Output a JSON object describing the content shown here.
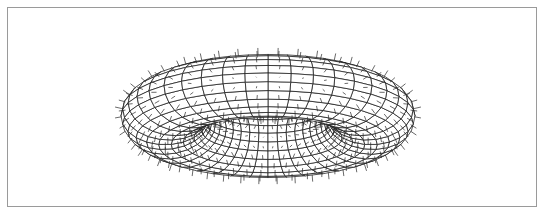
{
  "figure": {
    "caption": "",
    "colors": {
      "background": "#ffffff",
      "frame": "#9a9a9a",
      "wire": "#1a1a1a",
      "normals": "#2a2a2a",
      "fill": "#ffffff"
    },
    "torus": {
      "center_x": 268,
      "center_y": 116,
      "major_radius": 103,
      "tube_radius_horizontal": 44,
      "tube_radius_vertical": 30,
      "tilt_degrees": 17,
      "u_segments": 40,
      "v_segments": 22,
      "normal_length": 7
    }
  }
}
